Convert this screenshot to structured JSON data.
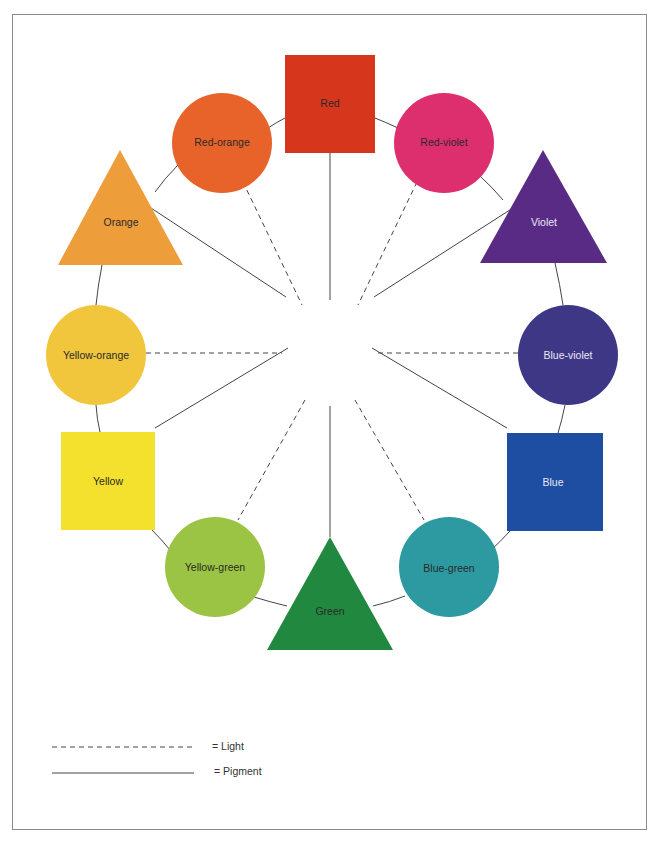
{
  "diagram": {
    "type": "color-wheel",
    "center": {
      "x": 330,
      "y": 325
    },
    "nodes": [
      {
        "id": "red",
        "label": "Red",
        "shape": "square",
        "color": "#d6361c",
        "text_color": "#3a1a10"
      },
      {
        "id": "red-violet",
        "label": "Red-violet",
        "shape": "circle",
        "color": "#dd2f6e",
        "text_color": "#3a1020"
      },
      {
        "id": "violet",
        "label": "Violet",
        "shape": "triangle",
        "color": "#5a2b84",
        "text_color": "#e8e4f0"
      },
      {
        "id": "blue-violet",
        "label": "Blue-violet",
        "shape": "circle",
        "color": "#3e3786",
        "text_color": "#e8e8f4"
      },
      {
        "id": "blue",
        "label": "Blue",
        "shape": "square",
        "color": "#1d4ea1",
        "text_color": "#e6ecf6"
      },
      {
        "id": "blue-green",
        "label": "Blue-green",
        "shape": "circle",
        "color": "#2d9aa1",
        "text_color": "#123638"
      },
      {
        "id": "green",
        "label": "Green",
        "shape": "triangle",
        "color": "#21883f",
        "text_color": "#0f3a1a"
      },
      {
        "id": "yellow-green",
        "label": "Yellow-green",
        "shape": "circle",
        "color": "#9cc444",
        "text_color": "#2a3a12"
      },
      {
        "id": "yellow",
        "label": "Yellow",
        "shape": "square",
        "color": "#f4e12e",
        "text_color": "#3a3410"
      },
      {
        "id": "yellow-orange",
        "label": "Yellow-orange",
        "shape": "circle",
        "color": "#f1c53c",
        "text_color": "#3a2e10"
      },
      {
        "id": "orange",
        "label": "Orange",
        "shape": "triangle",
        "color": "#ee9d3b",
        "text_color": "#3a2410"
      },
      {
        "id": "red-orange",
        "label": "Red-orange",
        "shape": "circle",
        "color": "#e8632a",
        "text_color": "#3a1a0e"
      }
    ],
    "spokes": [
      {
        "to": "red",
        "style": "solid"
      },
      {
        "to": "red-violet",
        "style": "dashed"
      },
      {
        "to": "violet",
        "style": "solid"
      },
      {
        "to": "blue-violet",
        "style": "dashed"
      },
      {
        "to": "blue",
        "style": "solid"
      },
      {
        "to": "blue-green",
        "style": "dashed"
      },
      {
        "to": "green",
        "style": "solid"
      },
      {
        "to": "yellow-green",
        "style": "dashed"
      },
      {
        "to": "yellow",
        "style": "solid"
      },
      {
        "to": "yellow-orange",
        "style": "dashed"
      },
      {
        "to": "orange",
        "style": "solid"
      },
      {
        "to": "red-orange",
        "style": "dashed"
      }
    ],
    "rim": "solid ring connecting adjacent nodes"
  },
  "legend": {
    "items": [
      {
        "style": "dashed",
        "label": "= Light"
      },
      {
        "style": "solid",
        "label": "= Pigment"
      }
    ]
  }
}
